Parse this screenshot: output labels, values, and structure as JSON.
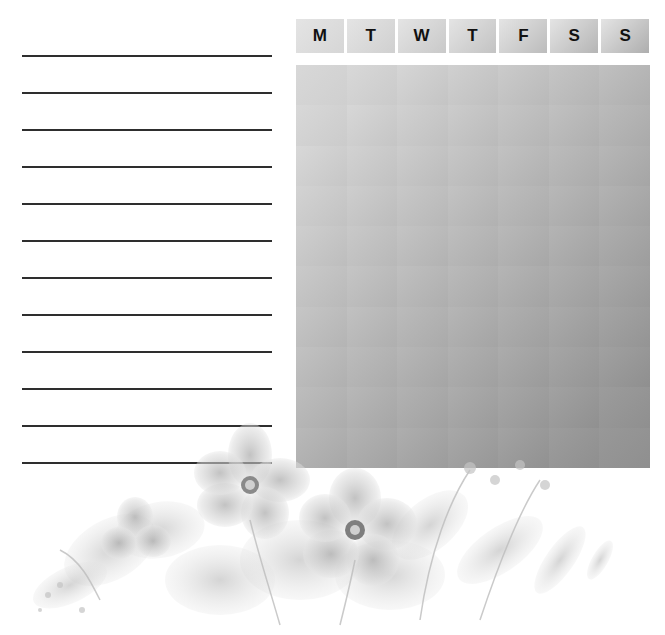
{
  "page": {
    "type": "weekly habit tracker",
    "note_lines": 12,
    "note_line_positions_y": [
      56,
      93,
      130,
      167,
      204,
      241,
      278,
      315,
      352,
      389,
      426,
      463
    ]
  },
  "tracker": {
    "days": [
      {
        "label": "M",
        "shade": "#d6d6d6"
      },
      {
        "label": "T",
        "shade": "#d0d0d0"
      },
      {
        "label": "W",
        "shade": "#c9c9c9"
      },
      {
        "label": "T",
        "shade": "#c3c3c3"
      },
      {
        "label": "F",
        "shade": "#bcbcbc"
      },
      {
        "label": "S",
        "shade": "#b5b5b5"
      },
      {
        "label": "S",
        "shade": "#aeaeae"
      }
    ],
    "rows": 10,
    "columns": 7,
    "cell_start_color": "#d8d8d8",
    "cell_end_color": "#8f8f8f"
  },
  "decoration": {
    "illustration": "grayscale watercolor flowers"
  }
}
